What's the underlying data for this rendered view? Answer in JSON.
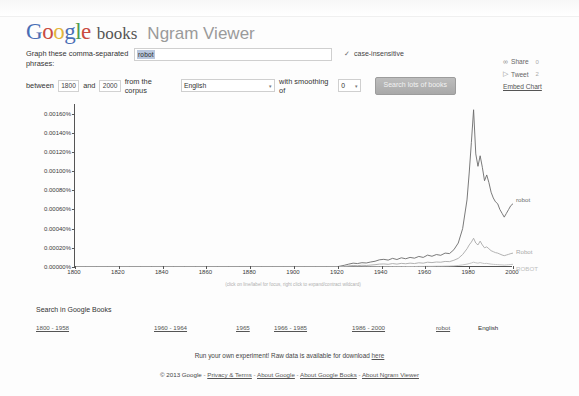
{
  "header": {
    "logo_letters": [
      "G",
      "o",
      "o",
      "g",
      "l",
      "e"
    ],
    "books_word": "books",
    "viewer_title": "Ngram Viewer"
  },
  "form": {
    "phrases_label": "Graph these comma-separated phrases:",
    "phrases_value": "robot",
    "phrases_placeholder": "",
    "case_insensitive_label": "case-insensitive",
    "case_insensitive_checked": true,
    "check_glyph": "✓",
    "between_label": "between",
    "start_year": "1800",
    "and_label": "and",
    "end_year": "2000",
    "corpus_label": "from the corpus",
    "corpus_value": "English",
    "smoothing_label": "with smoothing of",
    "smoothing_value": "0",
    "search_button": "Search lots of books",
    "caret_glyph": "▾"
  },
  "social": {
    "share_label": "Share",
    "share_count": "0",
    "share_icon": "share-icon",
    "tweet_label": "Tweet",
    "tweet_count": "2",
    "tweet_icon": "twitter-bird-icon",
    "embed_label": "Embed Chart"
  },
  "chart_data": {
    "type": "line",
    "title": "",
    "xlabel": "",
    "ylabel": "",
    "xlim": [
      1800,
      2000
    ],
    "ylim": [
      0,
      0.0017
    ],
    "grid": false,
    "legend_position": "right-inline",
    "hint": "(click on line/label for focus, right click to expand/contract wildcard)",
    "ytick_labels": [
      "0.00000%",
      "0.00020%",
      "0.00040%",
      "0.00060%",
      "0.00080%",
      "0.00100%",
      "0.00120%",
      "0.00140%",
      "0.00160%"
    ],
    "ytick_values": [
      0,
      0.0002,
      0.0004,
      0.0006,
      0.0008,
      0.001,
      0.0012,
      0.0014,
      0.0016
    ],
    "xtick_labels": [
      "1800",
      "1820",
      "1840",
      "1860",
      "1880",
      "1900",
      "1920",
      "1940",
      "1960",
      "1980",
      "2000"
    ],
    "xtick_values": [
      1800,
      1820,
      1840,
      1860,
      1880,
      1900,
      1920,
      1940,
      1960,
      1980,
      2000
    ],
    "x": [
      1800,
      1805,
      1810,
      1815,
      1820,
      1825,
      1830,
      1835,
      1840,
      1845,
      1850,
      1855,
      1860,
      1865,
      1870,
      1875,
      1880,
      1885,
      1890,
      1895,
      1900,
      1905,
      1910,
      1915,
      1920,
      1923,
      1925,
      1927,
      1929,
      1931,
      1933,
      1935,
      1937,
      1939,
      1941,
      1943,
      1945,
      1947,
      1949,
      1951,
      1953,
      1955,
      1957,
      1959,
      1961,
      1963,
      1965,
      1967,
      1969,
      1971,
      1973,
      1975,
      1977,
      1979,
      1980,
      1981,
      1982,
      1983,
      1984,
      1985,
      1986,
      1987,
      1988,
      1989,
      1990,
      1991,
      1992,
      1993,
      1994,
      1995,
      1996,
      1997,
      1998,
      1999,
      2000
    ],
    "series": [
      {
        "name": "robot",
        "color": "#6b6b6b",
        "values": [
          0.0,
          0.0,
          0.0,
          0.0,
          0.0,
          0.0,
          0.0,
          0.0,
          0.0,
          0.0,
          0.0,
          0.0,
          0.0,
          0.0,
          0.0,
          0.0,
          0.0,
          0.0,
          0.0,
          0.0,
          1e-06,
          1e-06,
          2e-06,
          2e-06,
          4e-06,
          1.8e-05,
          3e-05,
          4e-05,
          3.6e-05,
          4.5e-05,
          4.2e-05,
          5.2e-05,
          6e-05,
          7.5e-05,
          8e-05,
          7.2e-05,
          9e-05,
          7.8e-05,
          9.6e-05,
          8.6e-05,
          0.0001,
          9.2e-05,
          0.00011,
          0.0001,
          0.000124,
          0.000112,
          0.00013,
          0.000122,
          0.000145,
          0.00014,
          0.00018,
          0.00025,
          0.0004,
          0.0007,
          0.00098,
          0.0013,
          0.00164,
          0.00118,
          0.00105,
          0.00116,
          0.00104,
          0.0009,
          0.00096,
          0.00088,
          0.00078,
          0.00072,
          0.00068,
          0.00066,
          0.0006,
          0.00056,
          0.00052,
          0.00056,
          0.0006,
          0.00064,
          0.00066
        ]
      },
      {
        "name": "Robot",
        "color": "#a9a9a9",
        "values": [
          0.0,
          0.0,
          0.0,
          0.0,
          0.0,
          0.0,
          0.0,
          0.0,
          0.0,
          0.0,
          0.0,
          0.0,
          0.0,
          0.0,
          0.0,
          0.0,
          0.0,
          0.0,
          0.0,
          0.0,
          0.0,
          0.0,
          0.0,
          0.0,
          1e-06,
          6e-06,
          1.2e-05,
          1.6e-05,
          1.4e-05,
          1.8e-05,
          1.6e-05,
          2e-05,
          2.4e-05,
          3e-05,
          3.2e-05,
          2.8e-05,
          3.6e-05,
          3e-05,
          3.8e-05,
          3.4e-05,
          4e-05,
          3.6e-05,
          4.4e-05,
          4e-05,
          5e-05,
          4.6e-05,
          5.2e-05,
          5e-05,
          5.8e-05,
          5.6e-05,
          7e-05,
          9e-05,
          0.00013,
          0.00019,
          0.00023,
          0.00026,
          0.0003,
          0.00025,
          0.00023,
          0.00027,
          0.00023,
          0.0002,
          0.00021,
          0.00019,
          0.00017,
          0.00016,
          0.00015,
          0.000145,
          0.000135,
          0.000125,
          0.000118,
          0.000125,
          0.000132,
          0.00014,
          0.000145
        ]
      },
      {
        "name": "ROBOT",
        "color": "#bdbdbd",
        "values": [
          0.0,
          0.0,
          0.0,
          0.0,
          0.0,
          0.0,
          0.0,
          0.0,
          0.0,
          0.0,
          0.0,
          0.0,
          0.0,
          0.0,
          0.0,
          0.0,
          0.0,
          0.0,
          0.0,
          0.0,
          0.0,
          0.0,
          0.0,
          0.0,
          0.0,
          0.0,
          1e-06,
          1e-06,
          1e-06,
          1e-06,
          2e-06,
          2e-06,
          2e-06,
          3e-06,
          3e-06,
          3e-06,
          4e-06,
          4e-06,
          4e-06,
          5e-06,
          5e-06,
          5e-06,
          6e-06,
          6e-06,
          7e-06,
          7e-06,
          8e-06,
          8e-06,
          9e-06,
          1e-05,
          1.2e-05,
          1.6e-05,
          2.2e-05,
          3e-05,
          3.6e-05,
          4.2e-05,
          5e-05,
          4.4e-05,
          4e-05,
          4.6e-05,
          4e-05,
          3.6e-05,
          3.8e-05,
          3.4e-05,
          3e-05,
          2.8e-05,
          2.6e-05,
          2.5e-05,
          2.3e-05,
          2.2e-05,
          2e-05,
          2.2e-05,
          2.4e-05,
          2.6e-05,
          2.8e-05
        ]
      }
    ]
  },
  "search_books": {
    "title": "Search in Google Books",
    "ranges": [
      "1800 - 1958",
      "1960 - 1964",
      "1965",
      "1966 - 1985",
      "1986 - 2000"
    ],
    "query": "robot",
    "language": "English"
  },
  "footer": {
    "experiment_text": "Run your own experiment! Raw data is available for download",
    "experiment_link": "here",
    "copyright": "© 2013 Google",
    "links": [
      "Privacy & Terms",
      "About Google",
      "About Google Books",
      "About Ngram Viewer"
    ],
    "separator": "-"
  }
}
